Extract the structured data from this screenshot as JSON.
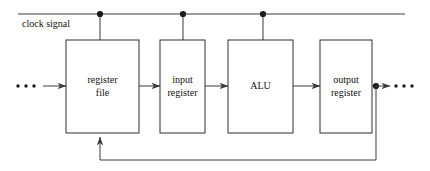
{
  "diagram": {
    "title": "clock signal",
    "canvas": {
      "width": 430,
      "height": 171,
      "background": "#ffffff"
    },
    "line_color": "#3a3a3a",
    "box_stroke": "#2e2e2e",
    "box_fill": "#ffffff",
    "text_color": "#111111",
    "clock": {
      "label": "clock signal",
      "line_y": 14,
      "line_x_start": 18,
      "line_x_end": 405,
      "tap_points": [
        100,
        183,
        263
      ]
    },
    "blocks": [
      {
        "id": "register-file",
        "label_line1": "register",
        "label_line2": "file",
        "x": 66,
        "y": 40,
        "width": 73,
        "height": 93
      },
      {
        "id": "input-register",
        "label_line1": "input",
        "label_line2": "register",
        "x": 160,
        "y": 40,
        "width": 45,
        "height": 93
      },
      {
        "id": "alu",
        "label_line1": "ALU",
        "label_line2": "",
        "x": 228,
        "y": 40,
        "width": 65,
        "height": 93
      },
      {
        "id": "output-register",
        "label_line1": "output",
        "label_line2": "register",
        "x": 320,
        "y": 40,
        "width": 52,
        "height": 93
      }
    ],
    "datapath": {
      "y": 86,
      "input_ellipsis_label": "...",
      "output_ellipsis_label": "...",
      "output_junction_x": 376,
      "feedback_y": 160,
      "feedback_target_x": 100
    }
  }
}
